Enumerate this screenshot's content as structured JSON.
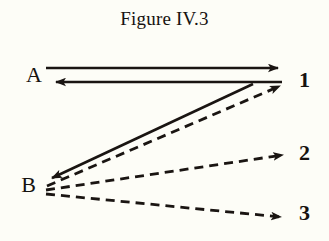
{
  "figure": {
    "title": "Figure IV.3",
    "background_color": "#fdfdf7",
    "ink_color": "#1a1512"
  },
  "nodes": {
    "left": [
      {
        "id": "A",
        "label": "A",
        "x": 38,
        "y": 75
      },
      {
        "id": "B",
        "label": "B",
        "x": 32,
        "y": 185
      }
    ],
    "right": [
      {
        "id": "1",
        "label": "1",
        "x": 300,
        "y": 81
      },
      {
        "id": "2",
        "label": "2",
        "x": 300,
        "y": 154
      },
      {
        "id": "3",
        "label": "3",
        "x": 300,
        "y": 214
      }
    ]
  },
  "edges": [
    {
      "id": "a-to-1",
      "from": "A",
      "to": "1",
      "style": "solid",
      "arrowhead": "end"
    },
    {
      "id": "1-to-a",
      "from": "1",
      "to": "A",
      "style": "solid",
      "arrowhead": "end"
    },
    {
      "id": "1-to-b",
      "from": "1",
      "to": "B",
      "style": "solid",
      "arrowhead": "end"
    },
    {
      "id": "b-to-1",
      "from": "B",
      "to": "1",
      "style": "dashed",
      "arrowhead": "end"
    },
    {
      "id": "b-to-2",
      "from": "B",
      "to": "2",
      "style": "dashed",
      "arrowhead": "end"
    },
    {
      "id": "b-to-3",
      "from": "B",
      "to": "3",
      "style": "dashed",
      "arrowhead": "end"
    }
  ]
}
